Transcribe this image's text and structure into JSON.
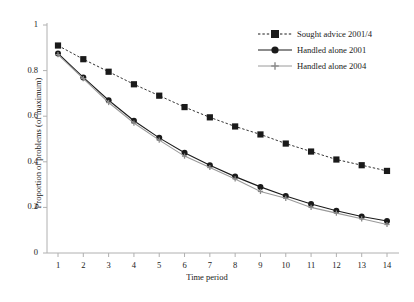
{
  "chart_data": {
    "type": "line",
    "title": "",
    "xlabel": "Time period",
    "ylabel": "Proportion of problems (of maximum)",
    "x": [
      1,
      2,
      3,
      4,
      5,
      6,
      7,
      8,
      9,
      10,
      11,
      12,
      13,
      14
    ],
    "xtick_labels": [
      "1",
      "2",
      "3",
      "4",
      "5",
      "6",
      "7",
      "8",
      "9",
      "10",
      "11",
      "12",
      "13",
      "14"
    ],
    "ytick_labels": [
      "0",
      "0.2",
      "0.4",
      "0.6",
      "0.8",
      "1"
    ],
    "ytick_values": [
      0,
      0.2,
      0.4,
      0.6,
      0.8,
      1
    ],
    "xlim": [
      1,
      14
    ],
    "ylim": [
      0,
      1
    ],
    "grid": false,
    "legend_position": "top-right",
    "series": [
      {
        "name": "Sought advice 2001/4",
        "marker": "square",
        "line_style": "dashed",
        "color": "#1a1a1a",
        "values": [
          0.91,
          0.85,
          0.795,
          0.74,
          0.69,
          0.64,
          0.595,
          0.555,
          0.52,
          0.48,
          0.445,
          0.41,
          0.385,
          0.36
        ]
      },
      {
        "name": "Handled alone 2001",
        "marker": "circle",
        "line_style": "solid",
        "color": "#1a1a1a",
        "values": [
          0.875,
          0.77,
          0.67,
          0.58,
          0.505,
          0.44,
          0.385,
          0.335,
          0.29,
          0.25,
          0.215,
          0.185,
          0.16,
          0.14
        ]
      },
      {
        "name": "Handled alone 2004",
        "marker": "plus",
        "line_style": "solid",
        "color": "#9a9a9a",
        "values": [
          0.87,
          0.765,
          0.66,
          0.57,
          0.495,
          0.425,
          0.375,
          0.325,
          0.27,
          0.24,
          0.2,
          0.175,
          0.15,
          0.125
        ]
      }
    ]
  },
  "axis": {
    "ylabel": "Proportion of problems (of maximum)",
    "xlabel": "Time period"
  },
  "legend": {
    "items": [
      {
        "label": "Sought advice 2001/4"
      },
      {
        "label": "Handled alone 2001"
      },
      {
        "label": "Handled alone 2004"
      }
    ]
  },
  "caption": {
    "text": ""
  }
}
